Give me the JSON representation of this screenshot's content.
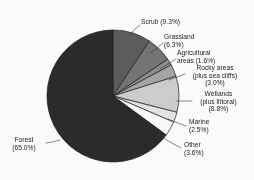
{
  "figure": {
    "background": "#fdfdfd",
    "text_color": "#242424",
    "leader_color": "#3a3a3a",
    "outline_color": "#1d1d1d"
  },
  "chart_data": {
    "type": "pie",
    "title": "",
    "xlabel": "",
    "ylabel": "",
    "legend_position": "callout-labels",
    "grid": false,
    "start_angle_deg": 0,
    "direction": "clockwise",
    "center": {
      "x": 113,
      "y": 96
    },
    "radius": 66,
    "units": "percent",
    "categories": [
      "Scrub",
      "Grassland",
      "Agricultural areas",
      "Rocky areas (plus sea cliffs)",
      "Wetlands (plus littoral)",
      "Marine",
      "Other",
      "Forest"
    ],
    "values": [
      9.3,
      6.3,
      1.6,
      3.0,
      8.8,
      2.5,
      3.6,
      65.0
    ],
    "slices": [
      {
        "key": "scrub",
        "name": "Scrub",
        "value": 9.3,
        "value_text": "(9.3%)",
        "color": "#5d5d5d",
        "label_lines": [
          "Scrub (9.3%)"
        ]
      },
      {
        "key": "grassland",
        "name": "Grassland",
        "value": 6.3,
        "value_text": "(6.3%)",
        "color": "#757575",
        "label_lines": [
          "Grassland",
          "(6.3%)"
        ]
      },
      {
        "key": "agricultural-areas",
        "name": "Agricultural areas",
        "value": 1.6,
        "value_text": "(1.6%)",
        "color": "#8e8e8e",
        "label_lines": [
          "Agricultural",
          "areas (1.6%)"
        ]
      },
      {
        "key": "rocky-areas",
        "name": "Rocky areas (plus sea cliffs)",
        "value": 3.0,
        "value_text": "(3.0%)",
        "color": "#a6a6a6",
        "label_lines": [
          "Rocky areas",
          "(plus sea cliffs)",
          "(3.0%)"
        ]
      },
      {
        "key": "wetlands",
        "name": "Wetlands (plus littoral)",
        "value": 8.8,
        "value_text": "(8.8%)",
        "color": "#cfcfcf",
        "label_lines": [
          "Wetlands",
          "(plus littoral)",
          "(8.8%)"
        ]
      },
      {
        "key": "marine",
        "name": "Marine",
        "value": 2.5,
        "value_text": "(2.5%)",
        "color": "#e6e6e6",
        "label_lines": [
          "Marine",
          "(2.5%)"
        ]
      },
      {
        "key": "other",
        "name": "Other",
        "value": 3.6,
        "value_text": "(3.6%)",
        "color": "#fbfbfb",
        "label_lines": [
          "Other",
          "(3.6%)"
        ]
      },
      {
        "key": "forest",
        "name": "Forest",
        "value": 65.0,
        "value_text": "(65.0%)",
        "color": "#2b2b2b",
        "label_lines": [
          "Forest",
          "(65.0%)"
        ]
      }
    ],
    "total": 100.1
  },
  "labels": {
    "scrub": {
      "l0": "Scrub (9.3%)",
      "l1": "",
      "l2": ""
    },
    "grassland": {
      "l0": "Grassland",
      "l1": "(6.3%)",
      "l2": ""
    },
    "agricultural": {
      "l0": "Agricultural",
      "l1": "areas (1.6%)",
      "l2": ""
    },
    "rocky": {
      "l0": "Rocky areas",
      "l1": "(plus sea cliffs)",
      "l2": "(3.0%)"
    },
    "wetlands": {
      "l0": "Wetlands",
      "l1": "(plus littoral)",
      "l2": "(8.8%)"
    },
    "marine": {
      "l0": "Marine",
      "l1": "(2.5%)",
      "l2": ""
    },
    "other": {
      "l0": "Other",
      "l1": "(3.6%)",
      "l2": ""
    },
    "forest": {
      "l0": "Forest",
      "l1": "(65.0%)",
      "l2": ""
    }
  }
}
